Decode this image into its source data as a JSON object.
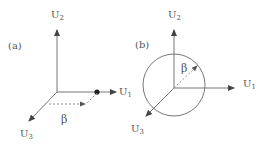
{
  "figure": {
    "panels": [
      {
        "id": "a",
        "label": "(a)",
        "axes": {
          "u1": {
            "label": "U",
            "sub": "1"
          },
          "u2": {
            "label": "U",
            "sub": "2"
          },
          "u3": {
            "label": "U",
            "sub": "3"
          }
        },
        "angle_label": "β",
        "features": [
          "point-on-U1-axis",
          "dashed-projection-arrow"
        ]
      },
      {
        "id": "b",
        "label": "(b)",
        "axes": {
          "u1": {
            "label": "U",
            "sub": "1"
          },
          "u2": {
            "label": "U",
            "sub": "2"
          },
          "u3": {
            "label": "U",
            "sub": "3"
          }
        },
        "angle_label": "β",
        "features": [
          "circle-around-origin",
          "dashed-radial-arrow"
        ]
      }
    ],
    "colors": {
      "axis": "#666666",
      "label": "#555555",
      "dashed": "#888888",
      "point": "#222222"
    }
  }
}
